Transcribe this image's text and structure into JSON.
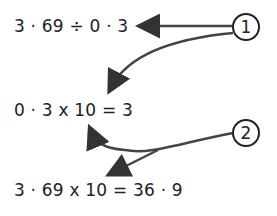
{
  "expressions": {
    "line1": "3 · 69 ÷ 0 · 3",
    "line2": "0 · 3 x 10 = 3",
    "line3": "3 · 69 x 10 = 36 · 9"
  },
  "labels": {
    "step1": "1",
    "step2": "2"
  },
  "colors": {
    "ink": "#222222",
    "arrow": "#3a3a3a",
    "background": "#ffffff"
  }
}
